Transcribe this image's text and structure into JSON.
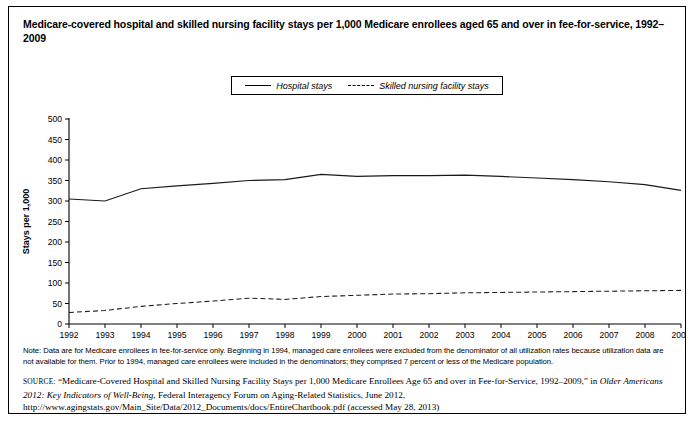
{
  "title": "Medicare-covered hospital and skilled nursing facility stays per 1,000 Medicare enrollees aged 65 and over in fee-for-service, 1992–2009",
  "legend": {
    "entries": [
      {
        "label": "Hospital stays",
        "style": "solid"
      },
      {
        "label": "Skilled nursing facility stays",
        "style": "dashed"
      }
    ]
  },
  "note": {
    "text": "Note: Data are for Medicare enrollees in fee-for-service only. Beginning in 1994, managed care enrollees were excluded from the denominator of all utilization rates because utilization data are not available for them. Prior to 1994, managed care enrollees were included in the denominators; they comprised 7 percent or less of the Medicare population."
  },
  "source": {
    "label": "SOURCE:",
    "part1": " “Medicare-Covered Hospital and Skilled Nursing Facility Stays per 1,000 Medicare Enrollees Age 65 and over in Fee-for-Service, 1992–2009,” in ",
    "italic": "Older Americans 2012: Key Indicators of Well-Being",
    "part2": ", Federal Interagency Forum on Aging-Related Statistics, June 2012, http://www.agingstats.gov/Main_Site/Data/2012_Documents/docs/EntireChartbook.pdf (accessed May 28, 2013)"
  },
  "chart_data": {
    "type": "line",
    "title": "Medicare-covered hospital and skilled nursing facility stays per 1,000 Medicare enrollees aged 65 and over in fee-for-service, 1992–2009",
    "xlabel": "",
    "ylabel": "Stays per 1,000",
    "x": [
      1992,
      1993,
      1994,
      1995,
      1996,
      1997,
      1998,
      1999,
      2000,
      2001,
      2002,
      2003,
      2004,
      2005,
      2006,
      2007,
      2008,
      2009
    ],
    "xticklabels": [
      "1992",
      "1993",
      "1994",
      "1995",
      "1996",
      "1997",
      "1998",
      "1999",
      "2000",
      "2001",
      "2002",
      "2003",
      "2004",
      "2005",
      "2006",
      "2007",
      "2008",
      "2009"
    ],
    "ylim": [
      0,
      500
    ],
    "yticks": [
      0,
      50,
      100,
      150,
      200,
      250,
      300,
      350,
      400,
      450,
      500
    ],
    "yticklabels": [
      "0",
      "50",
      "100",
      "150",
      "200",
      "250",
      "300",
      "350",
      "400",
      "450",
      "500"
    ],
    "grid": false,
    "legend_position": "top-center",
    "series": [
      {
        "name": "Hospital stays",
        "style": "solid",
        "values": [
          305,
          300,
          330,
          337,
          343,
          350,
          352,
          365,
          360,
          362,
          362,
          363,
          360,
          356,
          352,
          347,
          340,
          326
        ]
      },
      {
        "name": "Skilled nursing facility stays",
        "style": "dashed",
        "values": [
          28,
          33,
          43,
          50,
          56,
          63,
          60,
          67,
          70,
          73,
          74,
          76,
          77,
          78,
          79,
          80,
          81,
          82
        ]
      }
    ]
  }
}
